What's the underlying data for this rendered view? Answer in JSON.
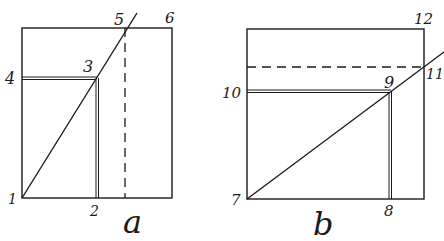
{
  "figures": [
    {
      "caption": "a",
      "points": [
        {
          "label": "1"
        },
        {
          "label": "2"
        },
        {
          "label": "3"
        },
        {
          "label": "4"
        },
        {
          "label": "5"
        },
        {
          "label": "6"
        }
      ]
    },
    {
      "caption": "b",
      "points": [
        {
          "label": "7"
        },
        {
          "label": "8"
        },
        {
          "label": "9"
        },
        {
          "label": "10"
        },
        {
          "label": "11"
        },
        {
          "label": "12"
        }
      ]
    }
  ],
  "colors": {
    "ink": "#1a1a1a",
    "paper": "#ffffff"
  }
}
